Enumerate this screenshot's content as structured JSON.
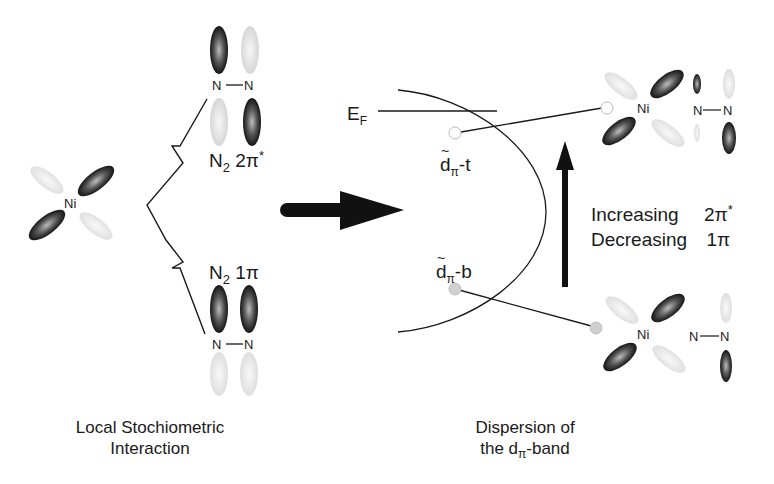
{
  "diagram": {
    "left_panel": {
      "metal_label": "Ni",
      "n2_upper": {
        "atom1": "N",
        "atom2": "N",
        "label_main": "N",
        "label_sub": "2",
        "label_orbital": "2π",
        "label_sup": "*"
      },
      "n2_lower": {
        "atom1": "N",
        "atom2": "N",
        "label_main": "N",
        "label_sub": "2",
        "label_orbital": "1π"
      },
      "caption_line1": "Local Stochiometric",
      "caption_line2": "Interaction"
    },
    "transition_arrow": {
      "direction": "right",
      "color": "#111111"
    },
    "right_panel": {
      "fermi_label_main": "E",
      "fermi_label_sub": "F",
      "state_top": {
        "main": "d",
        "sub": "π",
        "suffix": "-t"
      },
      "state_bottom": {
        "main": "d",
        "sub": "π",
        "suffix": "-b"
      },
      "trend_line1_word": "Increasing",
      "trend_line1_orbital": "2π",
      "trend_line1_sup": "*",
      "trend_line2_word": "Decreasing",
      "trend_line2_orbital": "1π",
      "upper_complex": {
        "metal": "Ni",
        "atom1": "N",
        "atom2": "N"
      },
      "lower_complex": {
        "metal": "Ni",
        "atom1": "N",
        "atom2": "N"
      },
      "caption_line1": "Dispersion of",
      "caption_line2_pre": "the d",
      "caption_line2_sub": "π",
      "caption_line2_post": "-band"
    },
    "colors": {
      "ink": "#1a1a1a",
      "lobe_dark": "#222222",
      "lobe_faint": "#d8d8d8",
      "state_top_fill": "#ffffff",
      "state_bottom_fill": "#cfcfcf"
    }
  }
}
